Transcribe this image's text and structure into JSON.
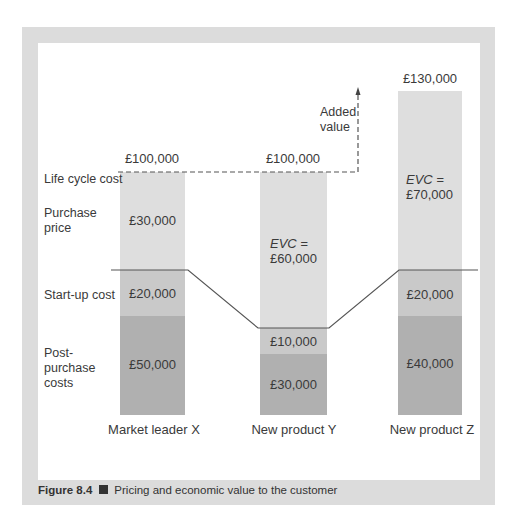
{
  "figure": {
    "number": "Figure 8.4",
    "title": "Pricing and economic value to the customer"
  },
  "row_labels": {
    "life_cycle_cost": "Life cycle cost",
    "purchase_price_1": "Purchase",
    "purchase_price_2": "price",
    "startup_cost": "Start-up cost",
    "post_purchase_1": "Post-",
    "post_purchase_2": "purchase",
    "post_purchase_3": "costs"
  },
  "annotation": {
    "added_value_1": "Added",
    "added_value_2": "value"
  },
  "bars": [
    {
      "name": "Market leader X",
      "total": "£100,000",
      "purchase_price": "£30,000",
      "startup_cost": "£20,000",
      "post_purchase": "£50,000"
    },
    {
      "name": "New product Y",
      "total": "£100,000",
      "evc_label": "EVC =",
      "evc_value": "£60,000",
      "startup_cost": "£10,000",
      "post_purchase": "£30,000"
    },
    {
      "name": "New product Z",
      "total": "£130,000",
      "evc_label": "EVC =",
      "evc_value": "£70,000",
      "startup_cost": "£20,000",
      "post_purchase": "£40,000"
    }
  ],
  "colors": {
    "frame": "#dcdcdc",
    "purchase_segment": "#dedede",
    "startup_segment": "#c9c9c9",
    "post_purchase_segment": "#b0b0b0",
    "lines": "#555555"
  }
}
